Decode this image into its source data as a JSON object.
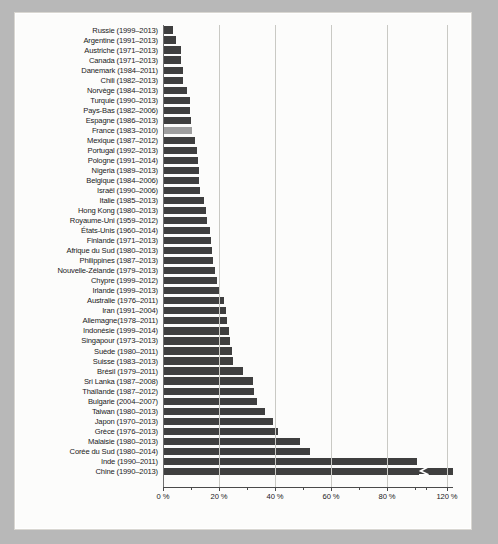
{
  "figure": {
    "background_color": "#b8b8b8",
    "paper_color": "#fcfcfb",
    "bar_color": "#3f3f3f",
    "highlight_color": "#9e9e9e",
    "grid_color": "#c9c9c4",
    "axis_color": "#4a4a4a",
    "break_icon": "axis-break-icon"
  },
  "chart_data": {
    "type": "bar",
    "orientation": "horizontal",
    "title": "",
    "subtitle": "",
    "xlabel": "",
    "ylabel": "",
    "xlim": [
      0,
      120
    ],
    "grid": true,
    "grid_axis": "x",
    "legend": null,
    "axis_break": {
      "present": true,
      "between": [
        90,
        110
      ],
      "note": "Chine bar is truncated with a break glyph near the 120 % tick"
    },
    "xticks": [
      0,
      20,
      40,
      60,
      80,
      120
    ],
    "xtick_labels": [
      "0 %",
      "20 %",
      "40 %",
      "60 %",
      "80 %",
      "120 %"
    ],
    "highlight_category": "France (1983–2010)",
    "categories": [
      "Russie  (1999–2013)",
      "Argentine (1991–2013)",
      "Austriche (1971–2013)",
      "Canada  (1971–2013)",
      "Danemark (1984–2011)",
      "Chili (1982–2013)",
      "Norvège (1984–2013)",
      "Turquie (1990–2013)",
      "Pays-Bas (1982–2006)",
      "Espagne (1986–2013)",
      "France (1983–2010)",
      "Mexique (1987–2012)",
      "Portugal (1992–2013)",
      "Pologne (1991–2014)",
      "Nigeria (1989–2013)",
      "Belgique (1984–2006)",
      "Israël (1990–2006)",
      "Italie (1985–2013)",
      "Hong Kong (1980–2013)",
      "Royaume-Uni (1959–2012)",
      "États-Unis (1960–2014)",
      "Finlande (1971–2013)",
      "Afrique du Sud (1980–2013)",
      "Philippines (1987–2013)",
      "Nouvelle-Zélande (1979–2013)",
      "Chypre (1999–2012)",
      "Irlande (1999–2013)",
      "Australie (1976–2011)",
      "Iran (1991–2004)",
      "Allemagne(1978–2011)",
      "Indonésie (1999–2014)",
      "Singapour (1973–2013)",
      "Suède (1980–2011)",
      "Suisse (1983–2013)",
      "Brésil (1979–2011)",
      "Sri Lanka (1987–2008)",
      "Thaïlande (1987–2012)",
      "Bulgarie (2004–2007)",
      "Taiwan (1980–2013)",
      "Japon (1970–2013)",
      "Grèce (1976–2013)",
      "Malaisie (1980–2013)",
      "Corée du Sud (1980–2014)",
      "Inde (1990–2011)",
      "Chine (1990–2013)"
    ],
    "values": [
      3.4,
      4.8,
      6.4,
      6.6,
      7.0,
      7.2,
      8.6,
      9.6,
      9.8,
      10.0,
      10.2,
      11.6,
      12.0,
      12.4,
      12.8,
      13.0,
      13.2,
      14.6,
      15.4,
      15.8,
      16.8,
      17.2,
      17.6,
      18.0,
      18.6,
      19.4,
      20.4,
      21.8,
      22.6,
      23.0,
      23.4,
      24.0,
      24.6,
      25.0,
      28.6,
      32.2,
      32.4,
      33.6,
      36.4,
      39.4,
      41.0,
      49.0,
      52.6,
      92.0,
      120.0
    ],
    "value_unit": "%",
    "clipped_index": 44
  }
}
